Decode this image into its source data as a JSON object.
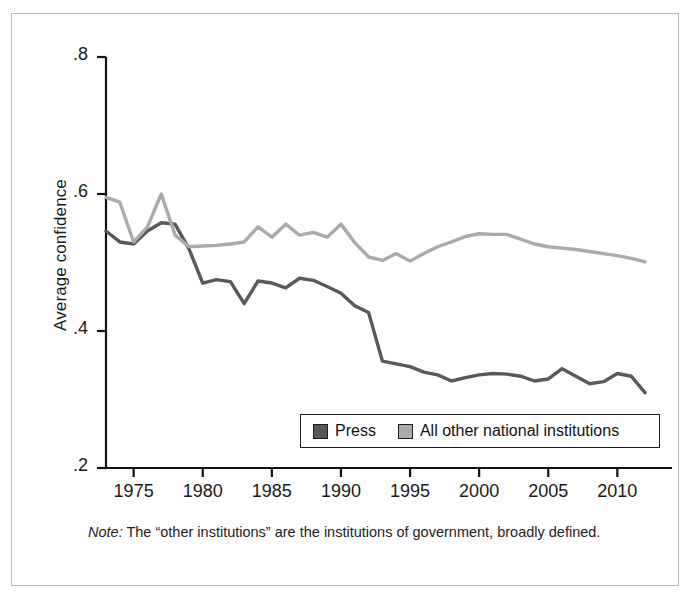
{
  "figure": {
    "note_prefix": "Note:",
    "note_text": " The “other institutions” are the institutions of government, broadly defined."
  },
  "legend": {
    "entries": [
      {
        "label": "Press",
        "color": "#595959"
      },
      {
        "label": "All other national institutions",
        "color": "#aaaaaa"
      }
    ]
  },
  "chart_data": {
    "type": "line",
    "title": "",
    "xlabel": "",
    "ylabel": "Average confidence",
    "xlim": [
      1973,
      2012
    ],
    "ylim": [
      0.2,
      0.8
    ],
    "xticks": [
      1975,
      1980,
      1985,
      1990,
      1995,
      2000,
      2005,
      2010
    ],
    "xtick_labels": [
      "1975",
      "1980",
      "1985",
      "1990",
      "1995",
      "2000",
      "2005",
      "2010"
    ],
    "yticks": [
      0.2,
      0.4,
      0.6,
      0.8
    ],
    "ytick_labels": [
      ".2",
      ".4",
      ".6",
      ".8"
    ],
    "grid": false,
    "legend_position": "lower-center",
    "x": [
      1973,
      1974,
      1975,
      1976,
      1977,
      1978,
      1979,
      1980,
      1981,
      1982,
      1983,
      1984,
      1985,
      1986,
      1987,
      1988,
      1989,
      1990,
      1991,
      1992,
      1993,
      1994,
      1995,
      1996,
      1997,
      1998,
      1999,
      2000,
      2001,
      2002,
      2003,
      2004,
      2005,
      2006,
      2007,
      2008,
      2009,
      2010,
      2011,
      2012
    ],
    "series": [
      {
        "name": "Press",
        "color": "#595959",
        "values": [
          0.546,
          0.53,
          0.527,
          0.546,
          0.558,
          0.556,
          0.52,
          0.47,
          0.475,
          0.472,
          0.44,
          0.473,
          0.47,
          0.463,
          0.477,
          0.474,
          0.465,
          0.455,
          0.437,
          0.427,
          0.356,
          0.352,
          0.348,
          0.34,
          0.336,
          0.327,
          0.332,
          0.336,
          0.338,
          0.337,
          0.334,
          0.327,
          0.33,
          0.345,
          0.334,
          0.323,
          0.326,
          0.338,
          0.334,
          0.31
        ]
      },
      {
        "name": "All other national institutions",
        "color": "#aaaaaa",
        "values": [
          0.595,
          0.588,
          0.53,
          0.552,
          0.6,
          0.54,
          0.523,
          0.524,
          0.525,
          0.527,
          0.53,
          0.552,
          0.537,
          0.556,
          0.54,
          0.544,
          0.537,
          0.556,
          0.529,
          0.508,
          0.503,
          0.513,
          0.502,
          0.513,
          0.523,
          0.53,
          0.538,
          0.542,
          0.541,
          0.541,
          0.534,
          0.527,
          0.523,
          0.521,
          0.519,
          0.516,
          0.513,
          0.51,
          0.506,
          0.501
        ]
      }
    ]
  }
}
